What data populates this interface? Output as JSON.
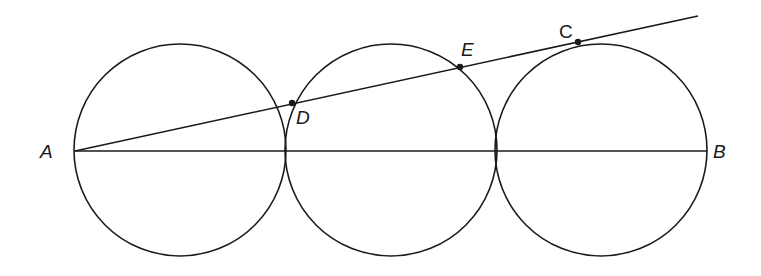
{
  "figure": {
    "stroke_color": "#1a1a1a",
    "background": "#ffffff"
  },
  "circles": [
    {
      "name": "circle-1",
      "cx": 180,
      "cy": 150,
      "r": 106
    },
    {
      "name": "circle-2",
      "cx": 391,
      "cy": 150,
      "r": 106
    },
    {
      "name": "circle-3",
      "cx": 601,
      "cy": 150,
      "r": 106
    }
  ],
  "segments": {
    "AB": {
      "x1": 75,
      "y1": 151,
      "x2": 707,
      "y2": 151
    },
    "tangent": {
      "x1": 75,
      "y1": 151,
      "x2": 698,
      "y2": 16
    }
  },
  "points": {
    "D": {
      "x": 292,
      "y": 103
    },
    "E": {
      "x": 460,
      "y": 67
    },
    "C": {
      "x": 578,
      "y": 42
    }
  },
  "labels": {
    "A": {
      "text": "A",
      "x": 40,
      "y": 158
    },
    "B": {
      "text": "B",
      "x": 713,
      "y": 158
    },
    "C": {
      "text": "C",
      "x": 559,
      "y": 38
    },
    "D": {
      "text": "D",
      "x": 296,
      "y": 124
    },
    "E": {
      "text": "E",
      "x": 461,
      "y": 56
    }
  }
}
